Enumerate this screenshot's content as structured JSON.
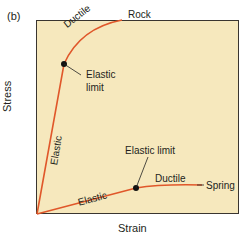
{
  "panel_label": "(b)",
  "axes": {
    "xlabel": "Strain",
    "ylabel": "Stress"
  },
  "colors": {
    "background": "#f6e8bd",
    "curve": "#e0572a",
    "axis": "#3a3530",
    "text": "#231f20"
  },
  "curves": {
    "rock": {
      "name": "Rock",
      "elastic_label": "Elastic",
      "ductile_label": "Ductile",
      "limit_label_line1": "Elastic",
      "limit_label_line2": "limit"
    },
    "spring": {
      "name": "Spring",
      "elastic_label": "Elastic",
      "ductile_label": "Ductile",
      "limit_label": "Elastic limit"
    }
  }
}
